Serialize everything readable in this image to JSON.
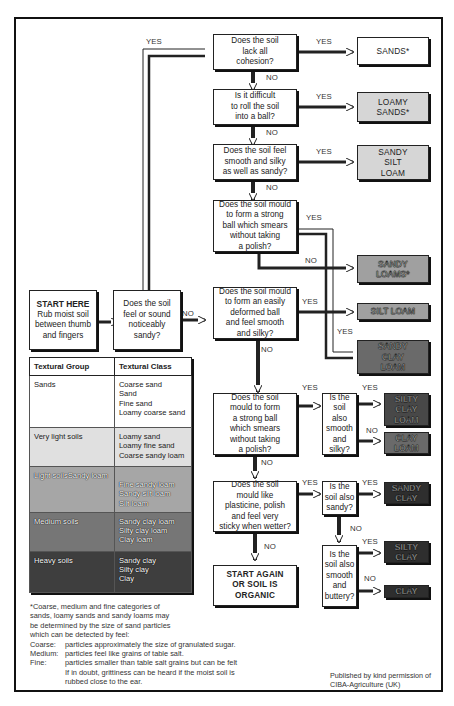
{
  "diagram": {
    "start": {
      "title": "START HERE",
      "text": "Rub moist soil\nbetween thumb\nand fingers"
    },
    "questions": {
      "q_sandy": "Does the soil\nfeel or sound\nnoticeably\nsandy?",
      "q_cohesion": "Does the soil\nlack all\ncohesion?",
      "q_roll": "Is it difficult\nto roll the soil\ninto a ball?",
      "q_silky_sandy": "Does the soil feel\nsmooth and silky\nas well as sandy?",
      "q_strong_ball_1": "Does the soil mould\nto form a strong\nball which smears\nwithout taking\na polish?",
      "q_easily_deformed": "Does the soil mould\nto form an easily\ndeformed ball\nand feel smooth\nand silky?",
      "q_strong_ball_2": "Does the soil\nmould to form\na strong ball\nwhich smears\nwithout taking\na polish?",
      "q_smooth_silky": "Is the\nsoil\nalso\nsmooth\nand\nsilky?",
      "q_plasticine": "Does the soil\nmould like\nplasticine, polish\nand feel very\nsticky when wetter?",
      "q_also_sandy": "Is the\nsoil also\nsandy?",
      "q_smooth_buttery": "Is the\nsoil also\nsmooth\nand\nbuttery?"
    },
    "results": {
      "sands": "SANDS*",
      "loamy_sands": "LOAMY\nSANDS*",
      "sandy_silt_loam": "SANDY\nSILT\nLOAM",
      "sandy_loams": "SANDY\nLOAMS*",
      "silt_loam": "SILT LOAM",
      "sandy_clay_loam": "SANDY\nCLAY\nLOAM",
      "silty_clay_loam": "SILTY\nCLAY\nLOAM",
      "clay_loam": "CLAY\nLOAM",
      "sandy_clay": "SANDY\nCLAY",
      "silty_clay": "SILTY\nCLAY",
      "clay": "CLAY",
      "organic": "START AGAIN\nOR SOIL IS\nORGANIC"
    },
    "labels": {
      "yes": "YES",
      "no": "NO"
    }
  },
  "table": {
    "headers": [
      "Textural Group",
      "Textural Class"
    ],
    "rows": [
      {
        "group": "Sands",
        "classes": "Coarse sand\nSand\nFine sand\nLoamy coarse sand"
      },
      {
        "group": "Very light soils",
        "classes": "Loamy sand\nLoamy fine sand\nCoarse sandy loam"
      },
      {
        "group": "Light soilsSandy loam",
        "classes": "Fine sandy loam\nSandy silt loam\nSilt loam"
      },
      {
        "group": "Medium soils",
        "classes": "Sandy clay loam\nSilty clay loam\nClay loam"
      },
      {
        "group": "Heavy soils",
        "classes": "Sandy clay\nSilty clay\nClay"
      }
    ]
  },
  "footnote": {
    "intro": "*Coarse, medium and fine categories of\nsands, loamy sands and sandy loams may\nbe determined by the size of sand particles\nwhich can be detected by feel:",
    "items": [
      {
        "key": "Coarse:",
        "text": "particles approximately the size of granulated sugar."
      },
      {
        "key": "Medium:",
        "text": "particles feel like grains of table salt."
      },
      {
        "key": "Fine:",
        "text": "particles smaller than table salt grains but can be felt\nIf in doubt, grittiness can be heard if the moist soil is\nrubbed close to the ear."
      }
    ]
  },
  "credit": "Published by kind permission of\nCIBA-Agriculture (UK)",
  "colors": {
    "light_gray": "#d6d6d6",
    "mid_gray": "#a0a0a0",
    "dark_gray": "#6a6a6a",
    "darker": "#484848",
    "darkest": "#2e2e2e"
  }
}
